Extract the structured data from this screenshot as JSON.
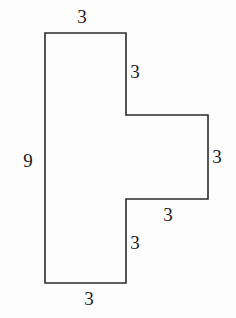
{
  "figure": {
    "background_color": "#fdfdfd",
    "stroke_color": "#2b2b2b",
    "stroke_width": 1.6,
    "text_color": "#1a1a1a",
    "units": "none",
    "outline_points": "45,33 126,33 126,115 208,115 208,199 126,199 126,283 45,283",
    "vertices": [
      {
        "name": "top-left",
        "x": 45,
        "y": 33
      },
      {
        "name": "top-right-of-stem",
        "x": 126,
        "y": 33
      },
      {
        "name": "upper-inner-corner",
        "x": 126,
        "y": 115
      },
      {
        "name": "arm-top-right",
        "x": 208,
        "y": 115
      },
      {
        "name": "arm-bottom-right",
        "x": 208,
        "y": 199
      },
      {
        "name": "lower-inner-corner",
        "x": 126,
        "y": 199
      },
      {
        "name": "bottom-right-of-stem",
        "x": 126,
        "y": 283
      },
      {
        "name": "bottom-left",
        "x": 45,
        "y": 283
      }
    ],
    "labels": [
      {
        "id": "top",
        "text": "3",
        "x": 82,
        "y": 16,
        "edge": "top edge of stem"
      },
      {
        "id": "upper-right",
        "text": "3",
        "x": 135,
        "y": 71,
        "edge": "upper right vertical of stem"
      },
      {
        "id": "far-right",
        "text": "3",
        "x": 217,
        "y": 156,
        "edge": "right edge of arm"
      },
      {
        "id": "arm-bottom",
        "text": "3",
        "x": 168,
        "y": 214,
        "edge": "bottom edge of arm"
      },
      {
        "id": "lower-right",
        "text": "3",
        "x": 135,
        "y": 242,
        "edge": "lower right vertical of stem"
      },
      {
        "id": "bottom",
        "text": "3",
        "x": 89,
        "y": 298,
        "edge": "bottom edge of stem"
      },
      {
        "id": "left",
        "text": "9",
        "x": 28,
        "y": 160,
        "edge": "left edge of stem"
      }
    ]
  }
}
